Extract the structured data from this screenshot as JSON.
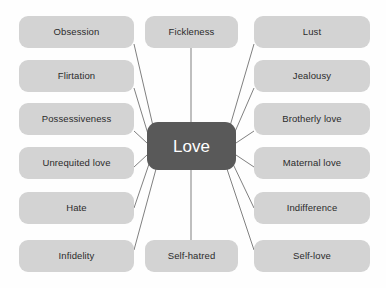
{
  "diagram": {
    "type": "mind-map",
    "center": {
      "label": "Love",
      "fill_color": "#595959",
      "text_color": "#ffffff"
    },
    "node_style": {
      "fill_color": "#d3d3d3",
      "text_color": "#2b2b2b",
      "connector_color": "#808080"
    },
    "background_color": "#ffffff",
    "branches": [
      {
        "label": "Obsession",
        "column": "left",
        "row": 1
      },
      {
        "label": "Flirtation",
        "column": "left",
        "row": 2
      },
      {
        "label": "Possessiveness",
        "column": "left",
        "row": 3
      },
      {
        "label": "Unrequited love",
        "column": "left",
        "row": 4
      },
      {
        "label": "Hate",
        "column": "left",
        "row": 5
      },
      {
        "label": "Infidelity",
        "column": "left",
        "row": 6
      },
      {
        "label": "Fickleness",
        "column": "middle",
        "row": 1
      },
      {
        "label": "Self-hatred",
        "column": "middle",
        "row": 6
      },
      {
        "label": "Lust",
        "column": "right",
        "row": 1
      },
      {
        "label": "Jealousy",
        "column": "right",
        "row": 2
      },
      {
        "label": "Brotherly love",
        "column": "right",
        "row": 3
      },
      {
        "label": "Maternal love",
        "column": "right",
        "row": 4
      },
      {
        "label": "Indifference",
        "column": "right",
        "row": 5
      },
      {
        "label": "Self-love",
        "column": "right",
        "row": 6
      }
    ]
  }
}
